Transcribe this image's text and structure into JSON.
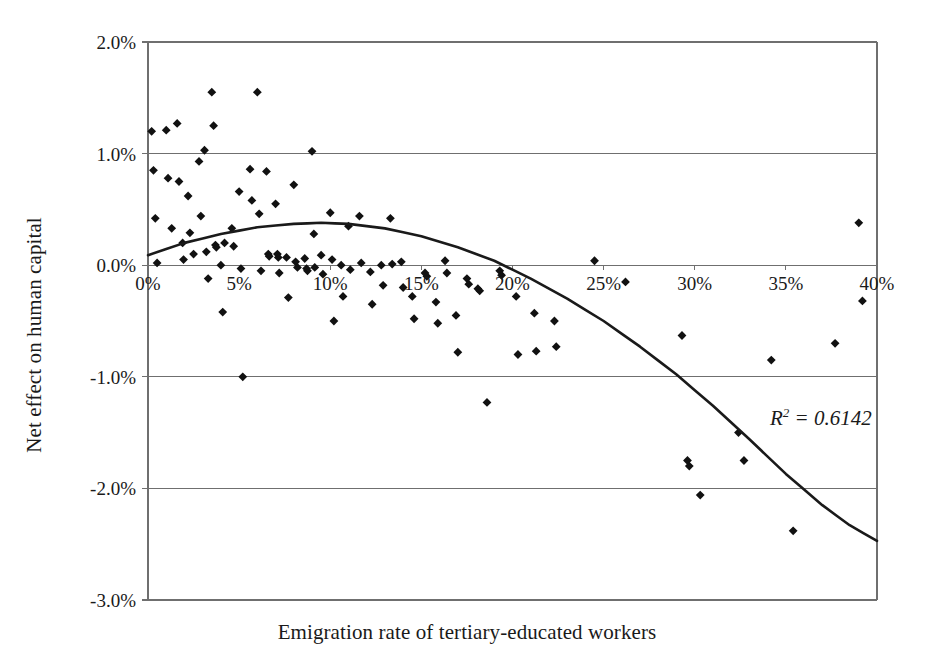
{
  "chart_data": {
    "type": "scatter",
    "title": "",
    "xlabel": "Emigration rate of tertiary-educated workers",
    "ylabel": "Net effect on human capital",
    "xlim": [
      0,
      40
    ],
    "ylim": [
      -3.0,
      2.0
    ],
    "xticks": [
      "0%",
      "5%",
      "10%",
      "15%",
      "20%",
      "25%",
      "30%",
      "35%",
      "40%"
    ],
    "xtick_values": [
      0,
      5,
      10,
      15,
      20,
      25,
      30,
      35,
      40
    ],
    "yticks": [
      "2.0%",
      "1.0%",
      "0.0%",
      "-1.0%",
      "-2.0%",
      "-3.0%"
    ],
    "ytick_values": [
      2.0,
      1.0,
      0.0,
      -1.0,
      -2.0,
      -3.0
    ],
    "grid": "horizontal",
    "legend": "none",
    "marker": "diamond",
    "marker_color": "#111111",
    "axis_color": "#6f6f6f",
    "trendline": {
      "type": "quadratic-polynomial",
      "color": "#1a1a1a",
      "width": 2.6,
      "annotation": "R² = 0.6142",
      "r_squared": 0.6142,
      "coefficients_note": "y = a + b*x + c*x^2 fitted through control points",
      "points": [
        [
          0,
          0.09
        ],
        [
          2,
          0.2
        ],
        [
          4,
          0.28
        ],
        [
          6,
          0.34
        ],
        [
          8,
          0.37
        ],
        [
          9.5,
          0.38
        ],
        [
          11,
          0.37
        ],
        [
          13,
          0.33
        ],
        [
          15,
          0.26
        ],
        [
          17,
          0.16
        ],
        [
          19,
          0.04
        ],
        [
          21,
          -0.12
        ],
        [
          23,
          -0.3
        ],
        [
          25,
          -0.5
        ],
        [
          27,
          -0.73
        ],
        [
          29,
          -0.98
        ],
        [
          31,
          -1.26
        ],
        [
          33,
          -1.56
        ],
        [
          35,
          -1.87
        ],
        [
          37,
          -2.15
        ],
        [
          38.5,
          -2.33
        ],
        [
          40,
          -2.47
        ]
      ]
    },
    "points": [
      [
        0.2,
        1.2
      ],
      [
        0.3,
        0.85
      ],
      [
        0.4,
        0.42
      ],
      [
        0.5,
        0.02
      ],
      [
        1.0,
        1.21
      ],
      [
        1.1,
        0.78
      ],
      [
        1.3,
        0.33
      ],
      [
        1.6,
        1.27
      ],
      [
        1.7,
        0.75
      ],
      [
        1.9,
        0.2
      ],
      [
        1.95,
        0.05
      ],
      [
        2.2,
        0.62
      ],
      [
        2.3,
        0.29
      ],
      [
        2.5,
        0.1
      ],
      [
        2.8,
        0.93
      ],
      [
        2.9,
        0.44
      ],
      [
        3.1,
        1.03
      ],
      [
        3.2,
        0.12
      ],
      [
        3.3,
        -0.12
      ],
      [
        3.5,
        1.55
      ],
      [
        3.6,
        1.25
      ],
      [
        3.7,
        0.18
      ],
      [
        3.75,
        0.16
      ],
      [
        4.0,
        0.0
      ],
      [
        4.1,
        -0.42
      ],
      [
        4.2,
        0.2
      ],
      [
        4.6,
        0.33
      ],
      [
        4.7,
        0.17
      ],
      [
        5.0,
        0.66
      ],
      [
        5.1,
        -0.03
      ],
      [
        5.2,
        -1.0
      ],
      [
        5.6,
        0.86
      ],
      [
        5.7,
        0.58
      ],
      [
        6.0,
        1.55
      ],
      [
        6.1,
        0.46
      ],
      [
        6.2,
        -0.05
      ],
      [
        6.5,
        0.84
      ],
      [
        6.6,
        0.1
      ],
      [
        6.65,
        0.08
      ],
      [
        7.0,
        0.55
      ],
      [
        7.1,
        0.1
      ],
      [
        7.15,
        0.07
      ],
      [
        7.2,
        -0.07
      ],
      [
        7.6,
        0.07
      ],
      [
        7.7,
        -0.29
      ],
      [
        8.0,
        0.72
      ],
      [
        8.1,
        0.03
      ],
      [
        8.2,
        -0.02
      ],
      [
        8.6,
        0.06
      ],
      [
        8.7,
        -0.03
      ],
      [
        8.75,
        -0.05
      ],
      [
        9.0,
        1.02
      ],
      [
        9.1,
        0.28
      ],
      [
        9.15,
        -0.02
      ],
      [
        9.5,
        0.09
      ],
      [
        9.6,
        -0.08
      ],
      [
        10.0,
        0.47
      ],
      [
        10.1,
        0.05
      ],
      [
        10.2,
        -0.5
      ],
      [
        10.6,
        0.0
      ],
      [
        10.7,
        -0.28
      ],
      [
        11.0,
        0.35
      ],
      [
        11.1,
        -0.04
      ],
      [
        11.6,
        0.44
      ],
      [
        11.7,
        0.02
      ],
      [
        12.2,
        -0.06
      ],
      [
        12.3,
        -0.35
      ],
      [
        12.8,
        0.0
      ],
      [
        12.9,
        -0.18
      ],
      [
        13.3,
        0.42
      ],
      [
        13.4,
        0.01
      ],
      [
        13.9,
        0.03
      ],
      [
        14.0,
        -0.2
      ],
      [
        14.5,
        -0.28
      ],
      [
        14.6,
        -0.48
      ],
      [
        15.2,
        -0.07
      ],
      [
        15.3,
        -0.1
      ],
      [
        15.8,
        -0.33
      ],
      [
        15.9,
        -0.52
      ],
      [
        16.3,
        0.04
      ],
      [
        16.4,
        -0.07
      ],
      [
        16.9,
        -0.45
      ],
      [
        17.0,
        -0.78
      ],
      [
        17.5,
        -0.12
      ],
      [
        17.6,
        -0.17
      ],
      [
        18.1,
        -0.21
      ],
      [
        18.2,
        -0.23
      ],
      [
        18.6,
        -1.23
      ],
      [
        19.3,
        -0.05
      ],
      [
        19.4,
        -0.09
      ],
      [
        20.2,
        -0.28
      ],
      [
        20.3,
        -0.8
      ],
      [
        21.2,
        -0.43
      ],
      [
        21.3,
        -0.77
      ],
      [
        22.3,
        -0.5
      ],
      [
        22.4,
        -0.73
      ],
      [
        24.5,
        0.04
      ],
      [
        26.2,
        -0.15
      ],
      [
        29.3,
        -0.63
      ],
      [
        29.6,
        -1.75
      ],
      [
        29.7,
        -1.8
      ],
      [
        30.3,
        -2.06
      ],
      [
        32.4,
        -1.5
      ],
      [
        32.7,
        -1.75
      ],
      [
        34.2,
        -0.85
      ],
      [
        35.4,
        -2.38
      ],
      [
        37.7,
        -0.7
      ],
      [
        39.0,
        0.38
      ],
      [
        39.2,
        -0.32
      ]
    ]
  }
}
